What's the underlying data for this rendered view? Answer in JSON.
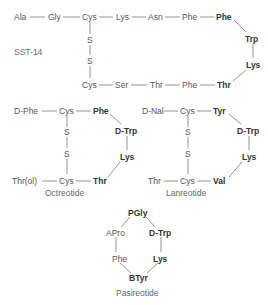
{
  "diagram": {
    "type": "peptide-structures",
    "colors": {
      "text": "#555555",
      "bold_text": "#333333",
      "line": "#777777",
      "background": "#ffffff"
    },
    "molecules": [
      {
        "name": "SST-14",
        "label": "SST-14",
        "residues": {
          "r1": "Ala",
          "r2": "Gly",
          "r3": "Cys",
          "r4": "Lys",
          "r5": "Asn",
          "r6": "Phe",
          "r7": "Phe",
          "r8": "Trp",
          "r9": "Lys",
          "r10": "Thr",
          "r11": "Phe",
          "r12": "Thr",
          "r13": "Ser",
          "r14": "Cys",
          "s1": "S",
          "s2": "S"
        },
        "bold_residues": [
          "Phe",
          "Trp",
          "Lys",
          "Thr"
        ]
      },
      {
        "name": "Octreotide",
        "label": "Octreotide",
        "residues": {
          "r1": "D-Phe",
          "r2": "Cys",
          "r3": "Phe",
          "r4": "D-Trp",
          "r5": "Lys",
          "r6": "Thr",
          "r7": "Cys",
          "r8": "Thr(ol)",
          "s1": "S",
          "s2": "S"
        },
        "bold_residues": [
          "Phe",
          "D-Trp",
          "Lys",
          "Thr"
        ]
      },
      {
        "name": "Lanreotide",
        "label": "Lanreotide",
        "residues": {
          "r1": "D-Nal",
          "r2": "Cys",
          "r3": "Tyr",
          "r4": "D-Trp",
          "r5": "Lys",
          "r6": "Val",
          "r7": "Cys",
          "r8": "Thr",
          "s1": "S",
          "s2": "S"
        },
        "bold_residues": [
          "Tyr",
          "D-Trp",
          "Lys",
          "Val"
        ]
      },
      {
        "name": "Pasireotide",
        "label": "Pasireotide",
        "residues": {
          "r1": "PGly",
          "r2": "D-Trp",
          "r3": "Lys",
          "r4": "BTyr",
          "r5": "Phe",
          "r6": "APro"
        },
        "bold_residues": [
          "PGly",
          "D-Trp",
          "Lys",
          "BTyr"
        ]
      }
    ]
  }
}
